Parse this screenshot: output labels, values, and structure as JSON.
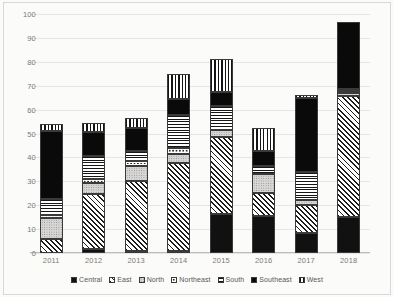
{
  "chart_data": {
    "type": "bar",
    "stacked": true,
    "title": "",
    "xlabel": "",
    "ylabel": "",
    "ylim": [
      0,
      100
    ],
    "ytick_step": 10,
    "yticks": [
      100,
      90,
      80,
      70,
      60,
      50,
      40,
      30,
      20,
      10,
      0
    ],
    "grid": true,
    "legend_position": "bottom",
    "categories": [
      "2011",
      "2012",
      "2013",
      "2014",
      "2015",
      "2016",
      "2017",
      "2018"
    ],
    "series": [
      {
        "name": "Central",
        "pattern": "solid-black",
        "values": [
          0.0,
          1.5,
          1.0,
          0.5,
          16.5,
          15.5,
          8.5,
          15.0
        ]
      },
      {
        "name": "East",
        "pattern": "diagonal-hatch",
        "values": [
          6.0,
          23.0,
          29.0,
          37.0,
          32.0,
          9.5,
          11.5,
          50.5
        ]
      },
      {
        "name": "North",
        "pattern": "light-dotted",
        "values": [
          8.5,
          5.0,
          6.5,
          3.5,
          3.0,
          8.0,
          2.0,
          1.5
        ]
      },
      {
        "name": "Northeast",
        "pattern": "white-outline",
        "values": [
          1.5,
          1.5,
          2.0,
          2.5,
          0.0,
          0.0,
          0.0,
          0.5
        ]
      },
      {
        "name": "South",
        "pattern": "horizontal-lines",
        "values": [
          6.5,
          9.5,
          4.0,
          14.0,
          10.0,
          3.5,
          12.0,
          0.5
        ]
      },
      {
        "name": "Southeast",
        "pattern": "dark-dotted",
        "values": [
          28.5,
          10.0,
          10.0,
          6.5,
          6.0,
          6.0,
          31.0,
          28.0
        ]
      },
      {
        "name": "West",
        "pattern": "vertical-lines",
        "values": [
          3.0,
          4.0,
          4.0,
          10.5,
          13.5,
          10.0,
          1.0,
          0.0
        ]
      }
    ],
    "totals": [
      54.0,
      54.5,
      56.5,
      74.5,
      81.0,
      52.5,
      66.0,
      96.0
    ]
  },
  "legend": {
    "items": [
      {
        "label": "Central"
      },
      {
        "label": "East"
      },
      {
        "label": "North"
      },
      {
        "label": "Northeast"
      },
      {
        "label": "South"
      },
      {
        "label": "Southeast"
      },
      {
        "label": "West"
      }
    ]
  },
  "colors": {
    "background": "#fbfbfa",
    "gridline": "#e6e5e3",
    "axis": "#bdbcba",
    "tick_text": "#7b7a78",
    "legend_text": "#585755",
    "bar_outline": "#3a3a3a"
  }
}
